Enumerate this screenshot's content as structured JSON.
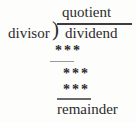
{
  "figure": {
    "quotient_label": "quotient",
    "divisor_label": "divisor",
    "bracket_glyph": ")",
    "dividend_label": "dividend",
    "step1_digits": "***",
    "step2_digits": "***",
    "step3_digits": "***",
    "remainder_label": "remainder",
    "colors": {
      "background": "#fdfdfc",
      "text": "#2b2b2b",
      "vinculum": "#3d3d3d",
      "rule_light": "#9a9a9a",
      "rule_dark": "#6b6b6b"
    }
  }
}
